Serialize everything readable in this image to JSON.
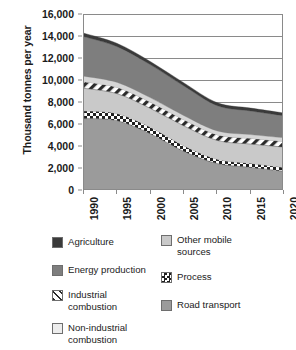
{
  "chart_data": {
    "type": "area",
    "title": "",
    "subtitle": "",
    "xlabel": "",
    "ylabel": "Thousand tonnes per year",
    "x": [
      1990,
      1995,
      2000,
      2005,
      2010,
      2015,
      2020
    ],
    "xlim": [
      1990,
      2020
    ],
    "ylim": [
      0,
      16000
    ],
    "y_ticks": [
      0,
      2000,
      4000,
      6000,
      8000,
      10000,
      12000,
      14000,
      16000
    ],
    "y_tick_labels": [
      "0",
      "2,000",
      "4,000",
      "6,000",
      "8,000",
      "10,000",
      "12,000",
      "14,000",
      "16,000"
    ],
    "x_tick_labels": [
      "1990",
      "1995",
      "2000",
      "2005",
      "2010",
      "2015",
      "2020"
    ],
    "grid": "horizontal",
    "stacked": true,
    "legend_position": "bottom",
    "stack_order_bottom_to_top": [
      "Road transport",
      "Process",
      "Non-industrial combustion",
      "Industrial combustion",
      "Other mobile sources",
      "Energy production",
      "Agriculture"
    ],
    "series": [
      {
        "name": "Road transport",
        "fill": "#9b9b9b",
        "pattern": "solid",
        "values": [
          6500,
          6300,
          5100,
          3500,
          2400,
          2050,
          1700
        ]
      },
      {
        "name": "Process",
        "fill": "#ffffff",
        "pattern": "checker",
        "values": [
          700,
          650,
          600,
          520,
          400,
          380,
          350
        ]
      },
      {
        "name": "Non-industrial combustion",
        "fill": "#c9c9c9",
        "pattern": "solid",
        "values": [
          2050,
          1800,
          1700,
          1800,
          1700,
          1750,
          1850
        ]
      },
      {
        "name": "Other mobile sources",
        "fill": "#d6d6d6",
        "pattern": "solid",
        "values": [
          500,
          450,
          400,
          380,
          350,
          340,
          330
        ]
      },
      {
        "name": "Industrial combustion",
        "fill": "#ffffff",
        "pattern": "diagonal",
        "values": [
          600,
          580,
          580,
          560,
          520,
          520,
          520
        ]
      },
      {
        "name": "Energy production",
        "fill": "#7e7e7e",
        "pattern": "solid",
        "values": [
          3600,
          3250,
          3000,
          2700,
          2300,
          2150,
          2000
        ]
      },
      {
        "name": "Agriculture",
        "fill": "#3a3a3a",
        "pattern": "solid",
        "values": [
          300,
          290,
          280,
          270,
          260,
          255,
          250
        ]
      }
    ],
    "totals": [
      14250,
      13320,
      11660,
      9730,
      7930,
      7445,
      7000
    ]
  },
  "legend": {
    "left_column": [
      {
        "label": "Agriculture",
        "swatch": "solid-darkest",
        "color": "#3a3a3a"
      },
      {
        "label": "Energy production",
        "swatch": "solid-dark",
        "color": "#7e7e7e"
      },
      {
        "label": "Industrial\ncombustion",
        "swatch": "diagonal-hatch",
        "color": "#ffffff"
      },
      {
        "label": "Non-industrial\ncombustion",
        "swatch": "solid-lightest",
        "color": "#ededed"
      }
    ],
    "right_column": [
      {
        "label": "Other mobile\nsources",
        "swatch": "solid-light",
        "color": "#c9c9c9"
      },
      {
        "label": "Process",
        "swatch": "checker",
        "color": "#ffffff"
      },
      {
        "label": "Road transport",
        "swatch": "solid-medium",
        "color": "#9b9b9b"
      }
    ]
  }
}
